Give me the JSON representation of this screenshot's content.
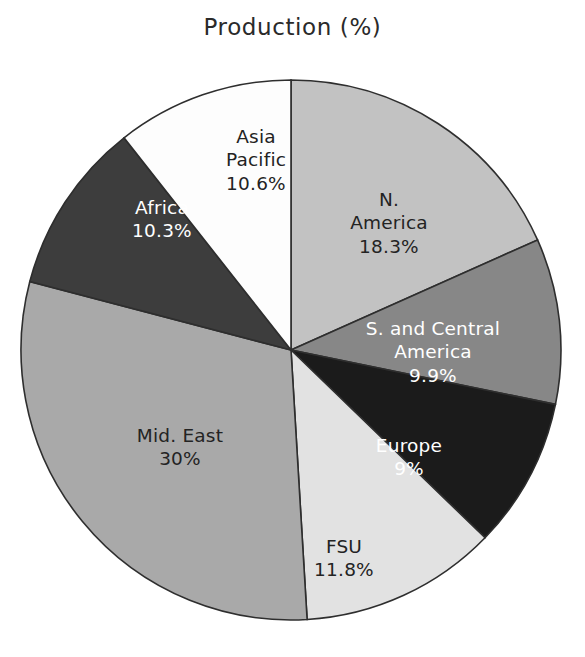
{
  "chart_data": {
    "type": "pie",
    "title": "Production (%)",
    "xlabel": "",
    "ylabel": "",
    "legend_position": "none",
    "grid": false,
    "labels_on_slices": true,
    "total": "99.9",
    "categories": [
      "N. America",
      "S. and Central America",
      "Europe",
      "FSU",
      "Mid. East",
      "Africa",
      "Asia Pacific"
    ],
    "values": [
      18.3,
      9.9,
      9.0,
      11.8,
      30.0,
      10.3,
      10.6
    ],
    "value_labels": [
      "18.3%",
      "9.9%",
      "9%",
      "11.8%",
      "30%",
      "10.3%",
      "10.6%"
    ],
    "colors": [
      "#c2c2c2",
      "#878787",
      "#1b1b1b",
      "#e2e2e2",
      "#a9a9a9",
      "#3d3d3d",
      "#fdfdfd"
    ],
    "slices": [
      {
        "name": "N. America",
        "name_line_1": "N.",
        "name_line_2": "America",
        "value": 18.3,
        "value_label": "18.3%",
        "color": "#c2c2c2",
        "text_color": "dark"
      },
      {
        "name": "S. and Central America",
        "name_line_1": "S. and Central",
        "name_line_2": "America",
        "value": 9.9,
        "value_label": "9.9%",
        "color": "#878787",
        "text_color": "light"
      },
      {
        "name": "Europe",
        "name_line_1": "Europe",
        "name_line_2": "",
        "value": 9.0,
        "value_label": "9%",
        "color": "#1b1b1b",
        "text_color": "light"
      },
      {
        "name": "FSU",
        "name_line_1": "FSU",
        "name_line_2": "",
        "value": 11.8,
        "value_label": "11.8%",
        "color": "#e2e2e2",
        "text_color": "dark"
      },
      {
        "name": "Mid. East",
        "name_line_1": "Mid. East",
        "name_line_2": "",
        "value": 30.0,
        "value_label": "30%",
        "color": "#a9a9a9",
        "text_color": "dark"
      },
      {
        "name": "Africa",
        "name_line_1": "Africa",
        "name_line_2": "",
        "value": 10.3,
        "value_label": "10.3%",
        "color": "#3d3d3d",
        "text_color": "light"
      },
      {
        "name": "Asia Pacific",
        "name_line_1": "Asia",
        "name_line_2": "Pacific",
        "value": 10.6,
        "value_label": "10.6%",
        "color": "#fdfdfd",
        "text_color": "dark"
      }
    ],
    "geometry": {
      "center_x": 291,
      "center_y": 350,
      "radius": 270,
      "start_angle_deg": -90,
      "direction": "clockwise"
    },
    "stroke_color": "#2e2e2e"
  },
  "caption": ""
}
